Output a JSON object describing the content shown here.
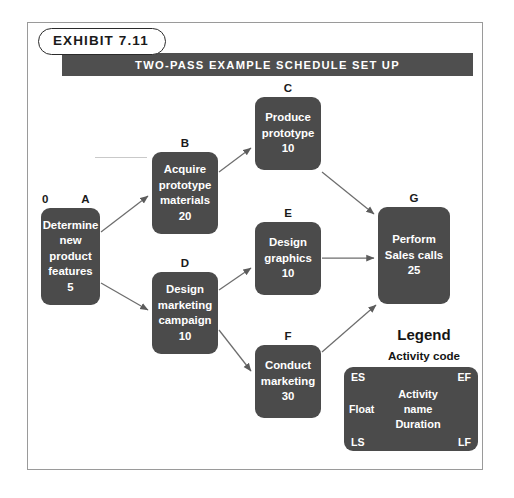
{
  "exhibit": {
    "pill_label": "EXHIBIT 7.11",
    "title": "TWO-PASS EXAMPLE SCHEDULE SET UP"
  },
  "colors": {
    "node_fill": "#4b4b4b",
    "title_bar": "#4f4f4f",
    "node_text": "#ffffff",
    "frame_border": "#9a9a9a",
    "label_text": "#1a1a1a",
    "arrow": "#5c5c5c"
  },
  "diagram": {
    "type": "activity-on-node-network",
    "nodes": [
      {
        "code": "A",
        "es_label": "0",
        "name_lines": [
          "Determine",
          "new",
          "product",
          "features"
        ],
        "duration": "5",
        "x": 41,
        "y": 208,
        "w": 59,
        "h": 97
      },
      {
        "code": "B",
        "es_label": "",
        "name_lines": [
          "Acquire",
          "prototype",
          "materials"
        ],
        "duration": "20",
        "x": 152,
        "y": 152,
        "w": 66,
        "h": 82
      },
      {
        "code": "C",
        "es_label": "",
        "name_lines": [
          "Produce",
          "prototype"
        ],
        "duration": "10",
        "x": 255,
        "y": 97,
        "w": 66,
        "h": 73
      },
      {
        "code": "D",
        "es_label": "",
        "name_lines": [
          "Design",
          "marketing",
          "campaign"
        ],
        "duration": "10",
        "x": 152,
        "y": 272,
        "w": 66,
        "h": 82
      },
      {
        "code": "E",
        "es_label": "",
        "name_lines": [
          "Design",
          "graphics"
        ],
        "duration": "10",
        "x": 255,
        "y": 222,
        "w": 66,
        "h": 73
      },
      {
        "code": "F",
        "es_label": "",
        "name_lines": [
          "Conduct",
          "marketing"
        ],
        "duration": "30",
        "x": 255,
        "y": 345,
        "w": 66,
        "h": 73
      },
      {
        "code": "G",
        "es_label": "",
        "name_lines": [
          "Perform",
          "Sales calls"
        ],
        "duration": "25",
        "x": 378,
        "y": 207,
        "w": 72,
        "h": 97
      }
    ],
    "edges": [
      {
        "from": "A",
        "to": "B"
      },
      {
        "from": "A",
        "to": "D"
      },
      {
        "from": "B",
        "to": "C"
      },
      {
        "from": "C",
        "to": "G"
      },
      {
        "from": "D",
        "to": "E"
      },
      {
        "from": "D",
        "to": "F"
      },
      {
        "from": "E",
        "to": "G"
      },
      {
        "from": "F",
        "to": "G"
      }
    ]
  },
  "legend": {
    "title": "Legend",
    "subtitle": "Activity code",
    "corners": {
      "es": "ES",
      "ef": "EF",
      "ls": "LS",
      "lf": "LF",
      "float": "Float"
    },
    "center_lines": [
      "Activity",
      "name",
      "Duration"
    ]
  }
}
